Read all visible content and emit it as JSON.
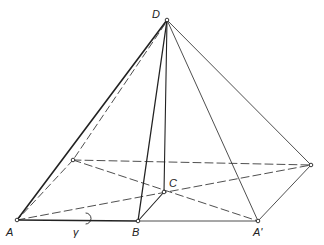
{
  "diagram": {
    "type": "pyramid-geometry",
    "labels": {
      "D": "D",
      "C": "C",
      "A": "A",
      "B": "B",
      "A_prime": "A'",
      "gamma": "γ"
    },
    "points": {
      "D": [
        167,
        20
      ],
      "A": [
        17,
        220
      ],
      "B": [
        138,
        221
      ],
      "C": [
        164,
        192
      ],
      "A_prime": [
        258,
        221
      ],
      "back_left": [
        73,
        160
      ],
      "back_right": [
        311,
        165
      ]
    },
    "colors": {
      "line": "#222222",
      "background": "#ffffff"
    }
  }
}
